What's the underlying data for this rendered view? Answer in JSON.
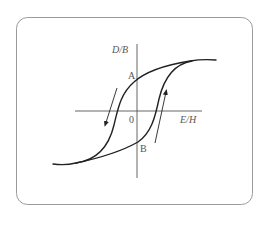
{
  "diagram": {
    "type": "hysteresis-loop",
    "axes": {
      "y_label": "D/B",
      "x_label": "E/H",
      "origin_label": "0"
    },
    "points": [
      {
        "label": "A",
        "meaning": "positive remanence (curve crosses vertical axis on descending branch)"
      },
      {
        "label": "B",
        "meaning": "negative remanence (curve crosses vertical axis on ascending branch)"
      }
    ],
    "arrows": [
      {
        "name": "descending-branch-arrow",
        "direction": "down-left"
      },
      {
        "name": "ascending-branch-arrow",
        "direction": "up-right"
      }
    ],
    "colors": {
      "curve": "#222222",
      "axes": "#555555",
      "frame": "#999999",
      "labels": "#555555"
    }
  }
}
